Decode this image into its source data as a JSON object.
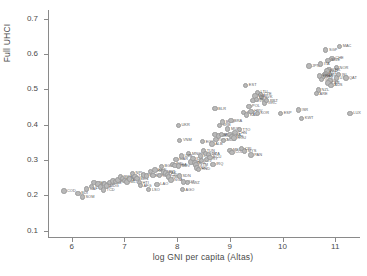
{
  "chart_data": {
    "type": "scatter",
    "title": "",
    "xlabel": "log GNI per capita (Altas)",
    "ylabel": "Full UHCI",
    "xlim": [
      5.55,
      11.45
    ],
    "ylim": [
      0.085,
      0.725
    ],
    "xticks": [
      "6",
      "7",
      "8",
      "9",
      "10",
      "11"
    ],
    "xtick_values": [
      6,
      7,
      8,
      9,
      10,
      11
    ],
    "yticks": [
      "0.1",
      "0.2",
      "0.3",
      "0.4",
      "0.5",
      "0.6",
      "0.7"
    ],
    "ytick_values": [
      0.1,
      0.2,
      0.3,
      0.4,
      0.5,
      0.6,
      0.7
    ],
    "grid": false,
    "legend": false,
    "marker_color": "#b8b8b8",
    "marker_edge_color": "#9a9a9a",
    "label_color": "#5d5d5d",
    "axis_color": "#8a8a8a",
    "point_label_key": "ISO3 country code",
    "points": [
      {
        "label": "COD",
        "x": 5.85,
        "y": 0.212
      },
      {
        "label": "BDI",
        "x": 6.12,
        "y": 0.206
      },
      {
        "label": "SOM",
        "x": 6.2,
        "y": 0.196
      },
      {
        "label": "CAF",
        "x": 6.28,
        "y": 0.218
      },
      {
        "label": "NER",
        "x": 6.38,
        "y": 0.226
      },
      {
        "label": "MWI",
        "x": 6.42,
        "y": 0.236
      },
      {
        "label": "MOZ",
        "x": 6.5,
        "y": 0.232
      },
      {
        "label": "SLE",
        "x": 6.55,
        "y": 0.224
      },
      {
        "label": "TCD",
        "x": 6.6,
        "y": 0.215
      },
      {
        "label": "LBR",
        "x": 6.62,
        "y": 0.232
      },
      {
        "label": "MDG",
        "x": 6.66,
        "y": 0.227
      },
      {
        "label": "GNB",
        "x": 6.72,
        "y": 0.236
      },
      {
        "label": "ETH",
        "x": 6.78,
        "y": 0.241
      },
      {
        "label": "TGO",
        "x": 6.84,
        "y": 0.239
      },
      {
        "label": "GMB",
        "x": 6.88,
        "y": 0.244
      },
      {
        "label": "RWA",
        "x": 6.92,
        "y": 0.252
      },
      {
        "label": "UGA",
        "x": 6.96,
        "y": 0.248
      },
      {
        "label": "BFA",
        "x": 7.0,
        "y": 0.243
      },
      {
        "label": "MLI",
        "x": 7.05,
        "y": 0.238
      },
      {
        "label": "GIN",
        "x": 7.1,
        "y": 0.246
      },
      {
        "label": "NPL",
        "x": 7.15,
        "y": 0.262
      },
      {
        "label": "TZA",
        "x": 7.2,
        "y": 0.254
      },
      {
        "label": "BEN",
        "x": 7.24,
        "y": 0.247
      },
      {
        "label": "HTI",
        "x": 7.28,
        "y": 0.236
      },
      {
        "label": "AFG",
        "x": 7.3,
        "y": 0.228
      },
      {
        "label": "ZWE",
        "x": 7.36,
        "y": 0.258
      },
      {
        "label": "SEN",
        "x": 7.42,
        "y": 0.255
      },
      {
        "label": "LSO",
        "x": 7.46,
        "y": 0.216
      },
      {
        "label": "KHM",
        "x": 7.5,
        "y": 0.268
      },
      {
        "label": "COM",
        "x": 7.54,
        "y": 0.257
      },
      {
        "label": "KEN",
        "x": 7.58,
        "y": 0.272
      },
      {
        "label": "LAO",
        "x": 7.62,
        "y": 0.231
      },
      {
        "label": "CMR",
        "x": 7.66,
        "y": 0.256
      },
      {
        "label": "BGD",
        "x": 7.7,
        "y": 0.282
      },
      {
        "label": "MRT",
        "x": 7.74,
        "y": 0.266
      },
      {
        "label": "PAK",
        "x": 7.78,
        "y": 0.263
      },
      {
        "label": "CIV",
        "x": 7.82,
        "y": 0.258
      },
      {
        "label": "ZMB",
        "x": 7.84,
        "y": 0.252
      },
      {
        "label": "NGA",
        "x": 7.88,
        "y": 0.244
      },
      {
        "label": "IND",
        "x": 7.92,
        "y": 0.288
      },
      {
        "label": "GHA",
        "x": 7.96,
        "y": 0.285
      },
      {
        "label": "MAR",
        "x": 7.98,
        "y": 0.302
      },
      {
        "label": "MDV",
        "x": 8.02,
        "y": 0.283
      },
      {
        "label": "SDN",
        "x": 8.04,
        "y": 0.255
      },
      {
        "label": "AGO",
        "x": 8.1,
        "y": 0.216
      },
      {
        "label": "VUT",
        "x": 8.12,
        "y": 0.238
      },
      {
        "label": "SWZ",
        "x": 8.2,
        "y": 0.236
      },
      {
        "label": "MNG",
        "x": 8.22,
        "y": 0.318
      },
      {
        "label": "UZB",
        "x": 8.08,
        "y": 0.312
      },
      {
        "label": "PHL",
        "x": 8.26,
        "y": 0.295
      },
      {
        "label": "IDN",
        "x": 8.3,
        "y": 0.304
      },
      {
        "label": "BOL",
        "x": 8.34,
        "y": 0.292
      },
      {
        "label": "GTM",
        "x": 8.36,
        "y": 0.286
      },
      {
        "label": "NIC",
        "x": 8.38,
        "y": 0.278
      },
      {
        "label": "HND",
        "x": 8.4,
        "y": 0.274
      },
      {
        "label": "LKA",
        "x": 8.44,
        "y": 0.312
      },
      {
        "label": "SLV",
        "x": 8.46,
        "y": 0.298
      },
      {
        "label": "EGY",
        "x": 8.48,
        "y": 0.352
      },
      {
        "label": "TUN",
        "x": 8.5,
        "y": 0.326
      },
      {
        "label": "JOR",
        "x": 8.54,
        "y": 0.318
      },
      {
        "label": "PRY",
        "x": 8.56,
        "y": 0.302
      },
      {
        "label": "DZA",
        "x": 8.6,
        "y": 0.316
      },
      {
        "label": "ECU",
        "x": 8.62,
        "y": 0.308
      },
      {
        "label": "ALB",
        "x": 8.66,
        "y": 0.346
      },
      {
        "label": "IRQ",
        "x": 8.68,
        "y": 0.288
      },
      {
        "label": "ARM",
        "x": 8.72,
        "y": 0.372
      },
      {
        "label": "GEO",
        "x": 8.74,
        "y": 0.358
      },
      {
        "label": "MKD",
        "x": 8.78,
        "y": 0.368
      },
      {
        "label": "SRB",
        "x": 8.8,
        "y": 0.398
      },
      {
        "label": "PER",
        "x": 8.84,
        "y": 0.372
      },
      {
        "label": "BGR",
        "x": 8.86,
        "y": 0.408
      },
      {
        "label": "MDA",
        "x": 8.88,
        "y": 0.356
      },
      {
        "label": "UKR",
        "x": 8.02,
        "y": 0.398
      },
      {
        "label": "VNM",
        "x": 8.05,
        "y": 0.356
      },
      {
        "label": "BRA",
        "x": 9.02,
        "y": 0.412
      },
      {
        "label": "MUS",
        "x": 8.96,
        "y": 0.388
      },
      {
        "label": "TTO",
        "x": 9.18,
        "y": 0.386
      },
      {
        "label": "THA",
        "x": 9.0,
        "y": 0.372
      },
      {
        "label": "TUR",
        "x": 9.04,
        "y": 0.366
      },
      {
        "label": "ROU",
        "x": 9.08,
        "y": 0.362
      },
      {
        "label": "CHN",
        "x": 9.1,
        "y": 0.378
      },
      {
        "label": "MEX",
        "x": 9.0,
        "y": 0.328
      },
      {
        "label": "RUS",
        "x": 9.26,
        "y": 0.434
      },
      {
        "label": "KAZ",
        "x": 9.32,
        "y": 0.428
      },
      {
        "label": "BLR",
        "x": 8.72,
        "y": 0.446
      },
      {
        "label": "COL",
        "x": 9.04,
        "y": 0.322
      },
      {
        "label": "MYS",
        "x": 9.28,
        "y": 0.326
      },
      {
        "label": "PAN",
        "x": 9.4,
        "y": 0.314
      },
      {
        "label": "CRI",
        "x": 9.22,
        "y": 0.332
      },
      {
        "label": "HRV",
        "x": 9.4,
        "y": 0.438
      },
      {
        "label": "POL",
        "x": 9.36,
        "y": 0.452
      },
      {
        "label": "SVN",
        "x": 9.44,
        "y": 0.468
      },
      {
        "label": "KOR",
        "x": 9.52,
        "y": 0.432
      },
      {
        "label": "EST",
        "x": 9.3,
        "y": 0.512
      },
      {
        "label": "CZE",
        "x": 9.58,
        "y": 0.486
      },
      {
        "label": "SVK",
        "x": 9.6,
        "y": 0.478
      },
      {
        "label": "LTU",
        "x": 9.52,
        "y": 0.492
      },
      {
        "label": "LVA",
        "x": 9.48,
        "y": 0.482
      },
      {
        "label": "HUN",
        "x": 9.5,
        "y": 0.472
      },
      {
        "label": "GRC",
        "x": 9.66,
        "y": 0.462
      },
      {
        "label": "PRT",
        "x": 9.7,
        "y": 0.468
      },
      {
        "label": "ESP",
        "x": 9.96,
        "y": 0.432
      },
      {
        "label": "ISR",
        "x": 10.3,
        "y": 0.442
      },
      {
        "label": "KWT",
        "x": 10.36,
        "y": 0.418
      },
      {
        "label": "JPN",
        "x": 10.5,
        "y": 0.566
      },
      {
        "label": "SGP",
        "x": 10.82,
        "y": 0.612
      },
      {
        "label": "MAC",
        "x": 11.08,
        "y": 0.622
      },
      {
        "label": "CHE",
        "x": 10.94,
        "y": 0.588
      },
      {
        "label": "SWE",
        "x": 10.86,
        "y": 0.582
      },
      {
        "label": "ITA",
        "x": 10.72,
        "y": 0.572
      },
      {
        "label": "NOR",
        "x": 11.02,
        "y": 0.562
      },
      {
        "label": "DNK",
        "x": 10.88,
        "y": 0.556
      },
      {
        "label": "NLD",
        "x": 10.84,
        "y": 0.552
      },
      {
        "label": "AUT",
        "x": 10.82,
        "y": 0.546
      },
      {
        "label": "DEU",
        "x": 10.8,
        "y": 0.542
      },
      {
        "label": "FIN",
        "x": 10.78,
        "y": 0.538
      },
      {
        "label": "BEL",
        "x": 10.76,
        "y": 0.534
      },
      {
        "label": "FRA",
        "x": 10.7,
        "y": 0.538
      },
      {
        "label": "GBR",
        "x": 10.74,
        "y": 0.528
      },
      {
        "label": "IRL",
        "x": 10.9,
        "y": 0.524
      },
      {
        "label": "CAN",
        "x": 10.86,
        "y": 0.518
      },
      {
        "label": "AUS",
        "x": 10.92,
        "y": 0.512
      },
      {
        "label": "USA",
        "x": 11.02,
        "y": 0.532
      },
      {
        "label": "ISL",
        "x": 11.06,
        "y": 0.542
      },
      {
        "label": "NZL",
        "x": 10.68,
        "y": 0.498
      },
      {
        "label": "ARE",
        "x": 10.64,
        "y": 0.488
      },
      {
        "label": "QAT",
        "x": 11.2,
        "y": 0.532
      },
      {
        "label": "LUX",
        "x": 11.28,
        "y": 0.432
      }
    ]
  }
}
